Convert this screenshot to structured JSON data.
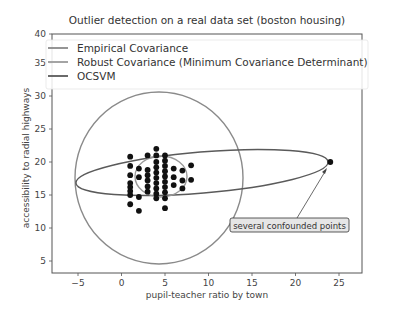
{
  "chart_data": {
    "type": "scatter",
    "title": "Outlier detection on a real data set (boston housing)",
    "xlabel": "pupil-teacher ratio by town",
    "ylabel": "accessibility to radial highways",
    "xlim": [
      -8,
      28
    ],
    "ylim": [
      3.2,
      40
    ],
    "xticks": [
      -5,
      0,
      5,
      10,
      15,
      20,
      25
    ],
    "yticks": [
      5,
      10,
      15,
      20,
      25,
      30,
      35,
      40
    ],
    "grid": false,
    "legend_position": "upper left",
    "legend": [
      {
        "label": "Empirical Covariance",
        "color": "#8a8a8a"
      },
      {
        "label": "Robust Covariance (Minimum Covariance Determinant)",
        "color": "#9a9a9a"
      },
      {
        "label": "OCSVM",
        "color": "#5a5a5a"
      }
    ],
    "series": [
      {
        "name": "data points",
        "color": "#111111",
        "points": [
          [
            1,
            20.8
          ],
          [
            1,
            19.4
          ],
          [
            1,
            18.0
          ],
          [
            1,
            16.8
          ],
          [
            1,
            16.2
          ],
          [
            1,
            15.6
          ],
          [
            1,
            15.0
          ],
          [
            1,
            13.6
          ],
          [
            2,
            19.0
          ],
          [
            2,
            17.7
          ],
          [
            2,
            14.7
          ],
          [
            2,
            12.6
          ],
          [
            3,
            21.0
          ],
          [
            3,
            18.8
          ],
          [
            3,
            18.0
          ],
          [
            3,
            17.2
          ],
          [
            3,
            16.3
          ],
          [
            3,
            15.5
          ],
          [
            4,
            22.0
          ],
          [
            4,
            21.0
          ],
          [
            4,
            20.0
          ],
          [
            4,
            19.2
          ],
          [
            4,
            18.4
          ],
          [
            4,
            17.6
          ],
          [
            4,
            16.8
          ],
          [
            4,
            16.0
          ],
          [
            4,
            15.2
          ],
          [
            4,
            14.5
          ],
          [
            5,
            21.0
          ],
          [
            5,
            20.2
          ],
          [
            5,
            19.4
          ],
          [
            5,
            18.6
          ],
          [
            5,
            17.8
          ],
          [
            5,
            17.0
          ],
          [
            5,
            16.2
          ],
          [
            5,
            15.4
          ],
          [
            5,
            14.5
          ],
          [
            5,
            13.0
          ],
          [
            6,
            19.0
          ],
          [
            6,
            17.7
          ],
          [
            6,
            16.5
          ],
          [
            7,
            18.7
          ],
          [
            7,
            17.2
          ],
          [
            7,
            16.0
          ],
          [
            8,
            19.5
          ],
          [
            8,
            17.3
          ],
          [
            24,
            20.0
          ]
        ]
      }
    ],
    "contours": [
      {
        "name": "Empirical Covariance",
        "shape": "ellipse",
        "center": [
          5.0,
          18.7
        ],
        "description": "large near-circular contour spanning x -5 to 14, y 4.6 to 30.8"
      },
      {
        "name": "Robust Covariance (Minimum Covariance Determinant)",
        "shape": "ellipse",
        "center": [
          5.1,
          19.0
        ],
        "description": "small contour around main cluster, x 2 to 8, y 14 to 20"
      },
      {
        "name": "OCSVM",
        "shape": "ellipse",
        "center": [
          9.5,
          18.5
        ],
        "description": "elongated contour from x -5.2 to 24, slightly tilted"
      }
    ],
    "annotations": [
      {
        "text": "several confounded points",
        "xy": [
          24,
          20
        ],
        "xytext": [
          13,
          10.5
        ],
        "arrow": true
      }
    ]
  }
}
